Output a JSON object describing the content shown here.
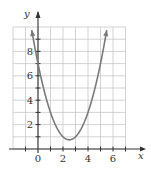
{
  "chart_data": {
    "type": "line",
    "title": "",
    "xlabel": "x",
    "ylabel": "y",
    "xlim": [
      -2,
      7
    ],
    "ylim": [
      0,
      10
    ],
    "grid": true,
    "x_ticks": [
      0,
      2,
      4,
      6
    ],
    "y_ticks": [
      2,
      4,
      6,
      8
    ],
    "x_tick_labels": [
      "0",
      "2",
      "4",
      "6"
    ],
    "y_tick_labels": [
      "2",
      "4",
      "6",
      "8"
    ],
    "series": [
      {
        "name": "parabola",
        "equation": "y = (x - 2.5)^2 + 0.75",
        "vertex": [
          2.5,
          0.75
        ],
        "y_intercept": 7,
        "x": [
          -0.5,
          0,
          0.5,
          1,
          1.5,
          2,
          2.5,
          3,
          3.5,
          4,
          4.5,
          5,
          5.5
        ],
        "values": [
          9.75,
          7,
          4.75,
          3,
          1.75,
          1,
          0.75,
          1,
          1.75,
          3,
          4.75,
          7,
          9.75
        ],
        "color": "#7a7a7a",
        "end_arrows": true
      }
    ]
  }
}
